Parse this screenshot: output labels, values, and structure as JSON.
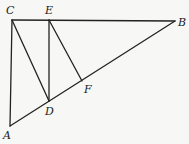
{
  "diagram": {
    "type": "geometry",
    "points": {
      "A": {
        "label": "A",
        "x": 10,
        "y": 126
      },
      "B": {
        "label": "B",
        "x": 175,
        "y": 21
      },
      "C": {
        "label": "C",
        "x": 12,
        "y": 20
      },
      "D": {
        "label": "D",
        "x": 49,
        "y": 101
      },
      "E": {
        "label": "E",
        "x": 49,
        "y": 20
      },
      "F": {
        "label": "F",
        "x": 82,
        "y": 81
      }
    },
    "segments": [
      {
        "from": "A",
        "to": "C"
      },
      {
        "from": "C",
        "to": "B"
      },
      {
        "from": "A",
        "to": "B"
      },
      {
        "from": "C",
        "to": "D"
      },
      {
        "from": "E",
        "to": "D"
      },
      {
        "from": "E",
        "to": "F"
      }
    ],
    "labels": [
      {
        "text": "C",
        "x": 6,
        "y": 14
      },
      {
        "text": "E",
        "x": 45,
        "y": 14
      },
      {
        "text": "B",
        "x": 178,
        "y": 26
      },
      {
        "text": "A",
        "x": 3,
        "y": 139
      },
      {
        "text": "D",
        "x": 45,
        "y": 115
      },
      {
        "text": "F",
        "x": 84,
        "y": 93
      }
    ],
    "colors": {
      "line": "#222222",
      "background": "#f7f7f5"
    }
  }
}
